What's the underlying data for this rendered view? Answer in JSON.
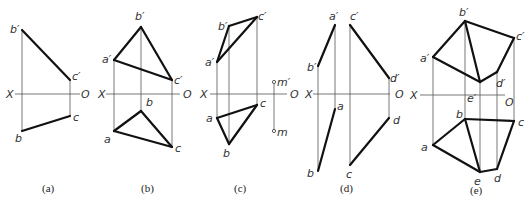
{
  "figure": {
    "panels": [
      {
        "id": "a",
        "caption": "(a)",
        "caption_pos": [
          42,
          192
        ],
        "axis": {
          "x1": 15,
          "x2": 80,
          "y": 94,
          "X_label": "X",
          "O_label": "O",
          "X_pos": [
            6,
            98
          ],
          "O_pos": [
            81,
            98
          ]
        },
        "projectors": [
          [
            22,
            30,
            22,
            131
          ],
          [
            70,
            80,
            70,
            116
          ]
        ],
        "edges": [
          [
            22,
            30,
            70,
            80
          ],
          [
            22,
            131,
            70,
            116
          ]
        ],
        "labels": [
          {
            "text": "b′",
            "x": 10,
            "y": 33
          },
          {
            "text": "c′",
            "x": 72,
            "y": 80
          },
          {
            "text": "c",
            "x": 73,
            "y": 121
          },
          {
            "text": "b",
            "x": 15,
            "y": 142
          }
        ]
      },
      {
        "id": "b",
        "caption": "(b)",
        "caption_pos": [
          141,
          192
        ],
        "axis": {
          "x1": 106,
          "x2": 180,
          "y": 94,
          "X_label": "X",
          "O_label": "O",
          "X_pos": [
            98,
            98
          ],
          "O_pos": [
            183,
            98
          ]
        },
        "projectors": [
          [
            114,
            60,
            114,
            131
          ],
          [
            141,
            27,
            141,
            111
          ],
          [
            172,
            80,
            172,
            147
          ]
        ],
        "edges": [
          [
            141,
            27,
            114,
            60
          ],
          [
            114,
            60,
            172,
            80
          ],
          [
            141,
            27,
            172,
            80
          ],
          [
            141,
            111,
            114,
            131
          ],
          [
            114,
            131,
            172,
            147
          ],
          [
            141,
            111,
            172,
            147
          ]
        ],
        "labels": [
          {
            "text": "b′",
            "x": 135,
            "y": 20
          },
          {
            "text": "a′",
            "x": 102,
            "y": 63
          },
          {
            "text": "c′",
            "x": 174,
            "y": 84
          },
          {
            "text": "b",
            "x": 146,
            "y": 106
          },
          {
            "text": "a",
            "x": 104,
            "y": 143
          },
          {
            "text": "c",
            "x": 175,
            "y": 152
          }
        ]
      },
      {
        "id": "c",
        "caption": "(c)",
        "caption_pos": [
          234,
          192
        ],
        "axis": {
          "x1": 210,
          "x2": 287,
          "y": 94,
          "X_label": "X",
          "O_label": "O",
          "X_pos": [
            200,
            98
          ],
          "O_pos": [
            290,
            98
          ]
        },
        "projectors": [
          [
            217,
            62,
            217,
            118
          ],
          [
            229,
            26,
            229,
            144
          ],
          [
            257,
            17,
            257,
            105
          ],
          [
            274,
            82,
            274,
            131
          ]
        ],
        "edges": [
          [
            229,
            26,
            257,
            17
          ],
          [
            229,
            26,
            217,
            62
          ],
          [
            217,
            62,
            257,
            17
          ],
          [
            217,
            118,
            257,
            105
          ],
          [
            217,
            118,
            229,
            144
          ],
          [
            229,
            144,
            257,
            105
          ]
        ],
        "points": [
          {
            "x": 274,
            "y": 82,
            "label": "m′",
            "lx": 277,
            "ly": 86
          },
          {
            "x": 274,
            "y": 131,
            "label": "m",
            "lx": 277,
            "ly": 136
          }
        ],
        "labels": [
          {
            "text": "b′",
            "x": 218,
            "y": 30
          },
          {
            "text": "c′",
            "x": 258,
            "y": 20
          },
          {
            "text": "a′",
            "x": 205,
            "y": 66
          },
          {
            "text": "c",
            "x": 260,
            "y": 107
          },
          {
            "text": "a",
            "x": 206,
            "y": 122
          },
          {
            "text": "b",
            "x": 223,
            "y": 157
          }
        ]
      },
      {
        "id": "d",
        "caption": "(d)",
        "caption_pos": [
          340,
          192
        ],
        "axis": {
          "x1": 313,
          "x2": 390,
          "y": 94,
          "X_label": "X",
          "O_label": "O",
          "X_pos": [
            305,
            98
          ],
          "O_pos": [
            395,
            98
          ]
        },
        "projectors": [
          [
            318,
            66,
            318,
            171
          ],
          [
            335,
            25,
            335,
            109
          ],
          [
            350,
            25,
            350,
            165
          ],
          [
            389,
            78,
            389,
            118
          ]
        ],
        "edges": [
          [
            335,
            25,
            318,
            66
          ],
          [
            350,
            25,
            389,
            78
          ],
          [
            335,
            109,
            318,
            171
          ],
          [
            389,
            118,
            350,
            165
          ]
        ],
        "labels": [
          {
            "text": "a′",
            "x": 329,
            "y": 20
          },
          {
            "text": "c′",
            "x": 350,
            "y": 20
          },
          {
            "text": "b′",
            "x": 307,
            "y": 71
          },
          {
            "text": "d′",
            "x": 390,
            "y": 82
          },
          {
            "text": "a",
            "x": 337,
            "y": 110
          },
          {
            "text": "d",
            "x": 393,
            "y": 124
          },
          {
            "text": "b",
            "x": 307,
            "y": 177
          },
          {
            "text": "c",
            "x": 346,
            "y": 178
          }
        ]
      },
      {
        "id": "e",
        "caption": "(e)",
        "caption_pos": [
          470,
          194
        ],
        "axis": {
          "x1": 420,
          "x2": 505,
          "y": 95,
          "X_label": "X",
          "O_label": "O",
          "X_pos": [
            410,
            99
          ],
          "O_pos": [
            505,
            106
          ]
        },
        "projectors": [
          [
            433,
            57,
            433,
            145
          ],
          [
            465,
            21,
            465,
            119
          ],
          [
            480,
            82,
            480,
            172
          ],
          [
            497,
            72,
            497,
            169
          ],
          [
            514,
            38,
            514,
            121
          ]
        ],
        "edges": [
          [
            465,
            21,
            433,
            57
          ],
          [
            465,
            21,
            514,
            38
          ],
          [
            465,
            21,
            480,
            82
          ],
          [
            433,
            57,
            480,
            82
          ],
          [
            480,
            82,
            497,
            72
          ],
          [
            497,
            72,
            514,
            38
          ],
          [
            465,
            119,
            433,
            145
          ],
          [
            465,
            119,
            514,
            121
          ],
          [
            465,
            119,
            480,
            172
          ],
          [
            433,
            145,
            480,
            172
          ],
          [
            480,
            172,
            497,
            169
          ],
          [
            497,
            169,
            514,
            121
          ]
        ],
        "labels": [
          {
            "text": "b′",
            "x": 459,
            "y": 16
          },
          {
            "text": "c′",
            "x": 516,
            "y": 40
          },
          {
            "text": "a′",
            "x": 420,
            "y": 62
          },
          {
            "text": "d′",
            "x": 496,
            "y": 87
          },
          {
            "text": "e′",
            "x": 467,
            "y": 102
          },
          {
            "text": "b",
            "x": 456,
            "y": 118
          },
          {
            "text": "c",
            "x": 518,
            "y": 126
          },
          {
            "text": "a",
            "x": 421,
            "y": 151
          },
          {
            "text": "e",
            "x": 474,
            "y": 185
          },
          {
            "text": "d",
            "x": 494,
            "y": 182
          }
        ]
      }
    ]
  }
}
